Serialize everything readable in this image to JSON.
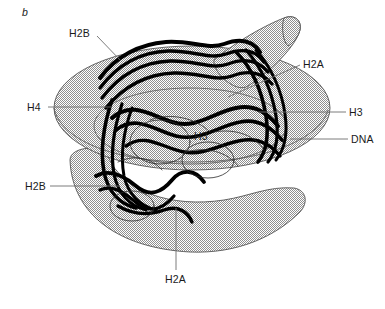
{
  "figure": {
    "panel_label": "b",
    "colors": {
      "dna_fill_stipple": "#9a9a9a",
      "dna_outline": "#555555",
      "histone_ribbon": "#000000",
      "leader_line": "#6e6e6e",
      "text": "#1a1a1a",
      "background": "#ffffff"
    }
  },
  "labels": [
    {
      "id": "h2b-top",
      "text": "H2B",
      "x": 69,
      "y": 28,
      "align": "left"
    },
    {
      "id": "h2a-right",
      "text": "H2A",
      "x": 303,
      "y": 59,
      "align": "left"
    },
    {
      "id": "h4-left",
      "text": "H4",
      "x": 27,
      "y": 102,
      "align": "left"
    },
    {
      "id": "h3-right",
      "text": "H3",
      "x": 349,
      "y": 107,
      "align": "left"
    },
    {
      "id": "dna-right",
      "text": "DNA",
      "x": 351,
      "y": 134,
      "align": "left"
    },
    {
      "id": "h3-inner",
      "text": "H3",
      "x": 194,
      "y": 131,
      "align": "left"
    },
    {
      "id": "h2b-left",
      "text": "H2B",
      "x": 25,
      "y": 181,
      "align": "left"
    },
    {
      "id": "h2a-bottom",
      "text": "H2A",
      "x": 165,
      "y": 274,
      "align": "left"
    }
  ],
  "leaders": [
    {
      "id": "leader-h2b-top",
      "points": "97,36 122,62"
    },
    {
      "id": "leader-h2a-right",
      "points": "300,65 228,97"
    },
    {
      "id": "leader-h4-left",
      "points": "48,107 112,107"
    },
    {
      "id": "leader-h3-right",
      "points": "346,112 258,112"
    },
    {
      "id": "leader-dna-right",
      "points": "348,139 290,139"
    },
    {
      "id": "leader-h2b-left",
      "points": "50,186 120,186"
    },
    {
      "id": "leader-h2a-bottom",
      "points": "176,270 176,208"
    }
  ]
}
